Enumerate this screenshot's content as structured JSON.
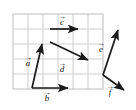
{
  "figure": {
    "background_color": "#ffffff",
    "grid": {
      "line_color": "#cfcfcf",
      "border_color": "#bdbdbd",
      "cell_size": 15,
      "columns": 6,
      "rows": 5,
      "origin_x": 13,
      "origin_y": 14,
      "width": 90,
      "height": 75,
      "visible": true
    },
    "vector_color": "#1a1a1a",
    "vectors": [
      {
        "name": "a",
        "label": "a",
        "arrow_over": true,
        "label_x": 28,
        "label_y": 66,
        "start": {
          "x": 32,
          "y": 88
        },
        "end": {
          "x": 42,
          "y": 44
        },
        "grid_start": {
          "x": 1,
          "y": 0
        },
        "grid_end": {
          "x": 2,
          "y": 3
        },
        "components": {
          "dx": 1,
          "dy": 3
        }
      },
      {
        "name": "b",
        "label": "b",
        "arrow_over": true,
        "label_x": 47,
        "label_y": 101,
        "start": {
          "x": 32,
          "y": 88
        },
        "end": {
          "x": 68,
          "y": 88
        },
        "grid_start": {
          "x": 1,
          "y": 0
        },
        "grid_end": {
          "x": 3.5,
          "y": 0
        },
        "components": {
          "dx": 2.5,
          "dy": 0
        }
      },
      {
        "name": "c",
        "label": "c",
        "arrow_over": true,
        "label_x": 62,
        "label_y": 25,
        "start": {
          "x": 50,
          "y": 29
        },
        "end": {
          "x": 78,
          "y": 29
        },
        "grid_start": {
          "x": 2.5,
          "y": 4
        },
        "grid_end": {
          "x": 4.3,
          "y": 4
        },
        "components": {
          "dx": 1.8,
          "dy": 0
        }
      },
      {
        "name": "d",
        "label": "d",
        "arrow_over": true,
        "label_x": 62,
        "label_y": 72,
        "start": {
          "x": 50,
          "y": 42
        },
        "end": {
          "x": 88,
          "y": 60
        },
        "grid_start": {
          "x": 2.5,
          "y": 3.1
        },
        "grid_end": {
          "x": 5,
          "y": 1.9
        },
        "components": {
          "dx": 2.5,
          "dy": -1.2
        }
      },
      {
        "name": "e",
        "label": "e",
        "arrow_over": true,
        "label_x": 101,
        "label_y": 52,
        "start": {
          "x": 103,
          "y": 75
        },
        "end": {
          "x": 118,
          "y": 30
        },
        "grid_start": {
          "x": 6,
          "y": 0.9
        },
        "grid_end": {
          "x": 7,
          "y": 3.9
        },
        "components": {
          "dx": 1,
          "dy": 3
        }
      },
      {
        "name": "f",
        "label": "f",
        "arrow_over": true,
        "label_x": 110,
        "label_y": 95,
        "start": {
          "x": 103,
          "y": 75
        },
        "end": {
          "x": 124,
          "y": 90
        },
        "grid_start": {
          "x": 6,
          "y": 0.9
        },
        "grid_end": {
          "x": 7.4,
          "y": -0.1
        },
        "components": {
          "dx": 1.4,
          "dy": -1
        }
      }
    ]
  }
}
